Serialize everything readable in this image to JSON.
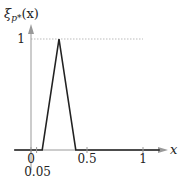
{
  "chart_data": {
    "type": "line",
    "title": "",
    "xlabel": "x",
    "ylabel": "ξ_{p*}(x)",
    "ylabel_main": "ξ",
    "ylabel_sub": "p*",
    "ylabel_arg": "(x)",
    "xlim": [
      -0.15,
      1.15
    ],
    "ylim": [
      0,
      1.1
    ],
    "grid": false,
    "x_ticks": [
      {
        "value": 0,
        "label": "0"
      },
      {
        "value": 0.05,
        "label": "0.05"
      },
      {
        "value": 0.5,
        "label": "0.5"
      },
      {
        "value": 1,
        "label": "1"
      }
    ],
    "y_ticks": [
      {
        "value": 1,
        "label": "1"
      }
    ],
    "series": [
      {
        "name": "triangular membership",
        "x": [
          -0.15,
          0.1,
          0.25,
          0.4,
          1.15
        ],
        "y": [
          0,
          0,
          1,
          0,
          0
        ]
      }
    ],
    "reference_lines": [
      {
        "type": "horizontal",
        "y": 1,
        "x_from": 0,
        "x_to": 1,
        "style": "dotted"
      }
    ]
  },
  "colors": {
    "curve": "#222222",
    "axis": "#999999",
    "reference": "#bbbbbb",
    "text": "#222222"
  }
}
